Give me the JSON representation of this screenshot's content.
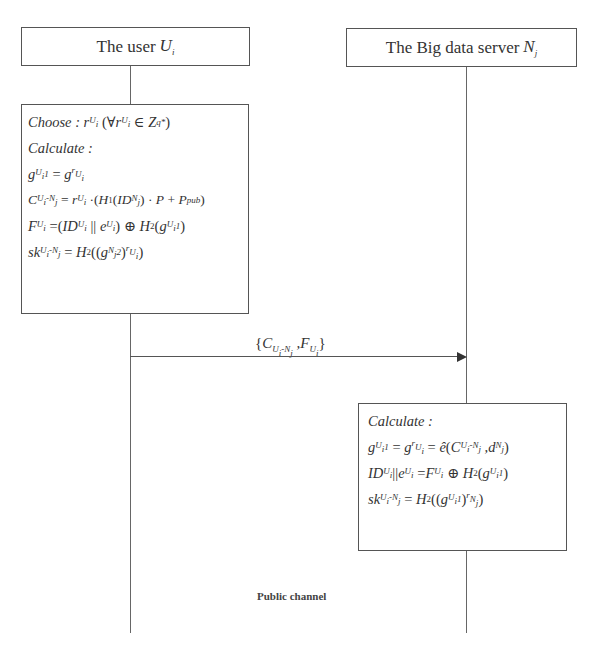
{
  "diagram": {
    "type": "sequence",
    "participants": [
      {
        "id": "user",
        "label": "The user",
        "symbol": "U",
        "subscript": "i"
      },
      {
        "id": "server",
        "label": "The Big data server",
        "symbol": "N",
        "subscript": "j"
      }
    ],
    "user_block": {
      "choose_label": "Choose :",
      "choose_expr": "r_{U_i} (∀ r_{U_i} ∈ Z_q^*)",
      "calculate_label": "Calculate :",
      "lines": [
        "g_{U_i}^1 = g^{r_{U_i}}",
        "C_{U_i-N_j} = r_{U_i} · (H_1(ID_{N_j}) · P + P_pub)",
        "F_{U_i} = (ID_{U_i} || e_{U_i}) ⊕ H_2(g_{U_i}^1)",
        "sk_{U_i-N_j} = H_2((g_{N_j}^2)^{r_{U_i}})"
      ]
    },
    "message": {
      "from": "user",
      "to": "server",
      "label": "{C_{U_i-N_j}, F_{U_i}}"
    },
    "server_block": {
      "calculate_label": "Calculate :",
      "lines": [
        "g_{U_i}^1 = g^{r_{U_i}} = ê(C_{U_i-N_j}, d_{N_j})",
        "ID_{U_i} || e_{U_i} = F_{U_i} ⊕ H_2(g_{U_i}^1)",
        "sk_{U_i-N_j} = H_2((g_{U_i}^1)^{r_{N_j}})"
      ]
    },
    "channel_label": "Public channel"
  },
  "text": {
    "user_title": "The user",
    "user_sym": "U",
    "user_sub": "i",
    "server_title": "The Big data server",
    "server_sym": "N",
    "server_sub": "j",
    "choose": "Choose :",
    "calculate": "Calculate :",
    "channel": "Public channel"
  },
  "colors": {
    "line": "#555555",
    "text": "#333333",
    "background": "#ffffff"
  }
}
